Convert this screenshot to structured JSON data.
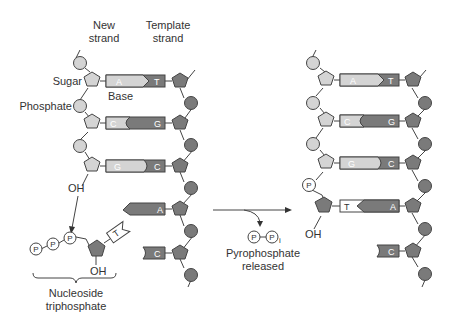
{
  "diagram": {
    "labels": {
      "new_strand_line1": "New",
      "new_strand_line2": "strand",
      "template_strand_line1": "Template",
      "template_strand_line2": "strand",
      "sugar": "Sugar",
      "phosphate": "Phosphate",
      "base": "Base",
      "oh_top": "OH",
      "oh_ntp": "OH",
      "oh_right": "OH",
      "nucleoside_line1": "Nucleoside",
      "nucleoside_line2": "triphosphate",
      "pyro_line1": "Pyrophosphate",
      "pyro_line2": "released",
      "p": "P",
      "pi_sub": "i"
    },
    "left_panel": {
      "pairs": [
        {
          "new": "A",
          "template": "T"
        },
        {
          "new": "C",
          "template": "G"
        },
        {
          "new": "G",
          "template": "C"
        },
        {
          "new": "",
          "template": "A"
        },
        {
          "new": "",
          "template": "C"
        }
      ],
      "incoming_nucleotide": {
        "base": "T",
        "phosphates": [
          "P",
          "P",
          "P"
        ]
      }
    },
    "right_panel": {
      "pairs": [
        {
          "new": "A",
          "template": "T"
        },
        {
          "new": "C",
          "template": "G"
        },
        {
          "new": "G",
          "template": "C"
        },
        {
          "new": "T",
          "template": "A"
        },
        {
          "new": "",
          "template": "C"
        }
      ],
      "added_phosphate": "P"
    },
    "colors": {
      "light_fill": "#d4d4d4",
      "dark_fill": "#7a7a7a",
      "white_fill": "#ffffff",
      "stroke": "#444444"
    }
  }
}
